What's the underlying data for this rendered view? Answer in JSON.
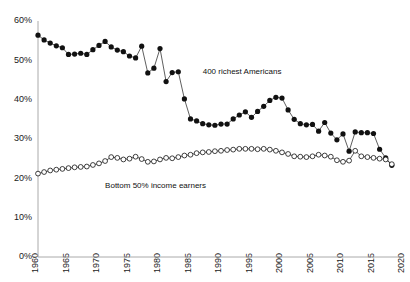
{
  "chart_data": {
    "type": "line",
    "title": "",
    "subtitle": "",
    "xlabel": "",
    "ylabel": "",
    "xlim": [
      1960,
      2020
    ],
    "ylim": [
      0,
      60
    ],
    "grid": false,
    "legend_position": "inline-annotation",
    "y_ticks": [
      0,
      10,
      20,
      30,
      40,
      50,
      60
    ],
    "y_tick_labels": [
      "0%",
      "10%",
      "20%",
      "30%",
      "40%",
      "50%",
      "60%"
    ],
    "x_ticks": [
      1960,
      1965,
      1970,
      1975,
      1980,
      1985,
      1990,
      1995,
      2000,
      2005,
      2010,
      2015,
      2020
    ],
    "x_tick_labels": [
      "1960",
      "1965",
      "1970",
      "1975",
      "1980",
      "1985",
      "1990",
      "1995",
      "2000",
      "2005",
      "2010",
      "2015",
      "2020"
    ],
    "series": [
      {
        "name": "400 richest Americans",
        "marker": "filled-circle",
        "color": "#111111",
        "annotation": "400 richest Americans",
        "annotation_x": 1987,
        "annotation_y": 46.5,
        "x": [
          1960,
          1961,
          1962,
          1963,
          1964,
          1965,
          1966,
          1967,
          1968,
          1969,
          1970,
          1971,
          1972,
          1973,
          1974,
          1975,
          1976,
          1977,
          1978,
          1979,
          1980,
          1981,
          1982,
          1983,
          1984,
          1985,
          1986,
          1987,
          1988,
          1989,
          1990,
          1991,
          1992,
          1993,
          1994,
          1995,
          1996,
          1997,
          1998,
          1999,
          2000,
          2001,
          2002,
          2003,
          2004,
          2005,
          2006,
          2007,
          2008,
          2009,
          2010,
          2011,
          2012,
          2013,
          2014,
          2015,
          2016,
          2017,
          2018
        ],
        "values": [
          56.4,
          55.2,
          54.4,
          53.7,
          53.2,
          51.5,
          51.6,
          51.8,
          51.5,
          52.7,
          53.8,
          54.8,
          53.4,
          52.6,
          52.2,
          51.1,
          50.6,
          53.6,
          46.8,
          48.0,
          53.0,
          44.6,
          46.9,
          47.1,
          40.2,
          35.1,
          34.6,
          33.9,
          33.6,
          33.5,
          33.8,
          33.8,
          35.1,
          36.1,
          36.9,
          35.5,
          37.0,
          38.3,
          39.8,
          40.6,
          40.4,
          37.4,
          35.0,
          33.9,
          33.6,
          33.7,
          32.0,
          34.2,
          31.5,
          29.8,
          31.3,
          26.9,
          31.8,
          31.6,
          31.6,
          31.4,
          27.4,
          25.2,
          23.3
        ]
      },
      {
        "name": "Bottom 50% income earners",
        "marker": "open-circle",
        "color": "#111111",
        "annotation": "Bottom 50% income earners",
        "annotation_x": 1971,
        "annotation_y": 17.5,
        "x": [
          1960,
          1961,
          1962,
          1963,
          1964,
          1965,
          1966,
          1967,
          1968,
          1969,
          1970,
          1971,
          1972,
          1973,
          1974,
          1975,
          1976,
          1977,
          1978,
          1979,
          1980,
          1981,
          1982,
          1983,
          1984,
          1985,
          1986,
          1987,
          1988,
          1989,
          1990,
          1991,
          1992,
          1993,
          1994,
          1995,
          1996,
          1997,
          1998,
          1999,
          2000,
          2001,
          2002,
          2003,
          2004,
          2005,
          2006,
          2007,
          2008,
          2009,
          2010,
          2011,
          2012,
          2013,
          2014,
          2015,
          2016,
          2017,
          2018
        ],
        "values": [
          21.2,
          21.6,
          22.0,
          22.2,
          22.4,
          22.6,
          22.8,
          22.9,
          23.0,
          23.4,
          23.8,
          24.4,
          25.4,
          25.2,
          24.8,
          25.0,
          25.5,
          24.9,
          24.2,
          24.3,
          24.8,
          25.2,
          25.1,
          25.4,
          25.8,
          26.0,
          26.4,
          26.6,
          26.7,
          26.9,
          27.0,
          27.2,
          27.3,
          27.5,
          27.5,
          27.5,
          27.4,
          27.5,
          27.3,
          27.0,
          26.6,
          26.2,
          25.6,
          25.5,
          25.4,
          25.6,
          26.0,
          25.8,
          25.5,
          24.6,
          24.2,
          24.5,
          27.0,
          25.6,
          25.4,
          25.2,
          25.0,
          24.8,
          23.6
        ]
      }
    ]
  }
}
